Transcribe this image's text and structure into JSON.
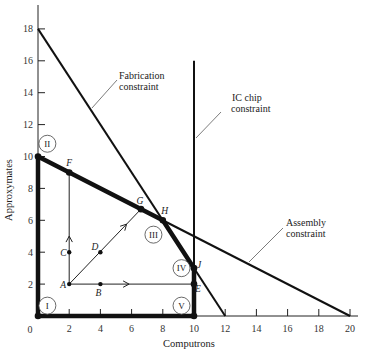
{
  "chart_data": {
    "type": "line",
    "title": "",
    "xlabel": "Computrons",
    "ylabel": "Approxymates",
    "xlim": [
      0,
      20
    ],
    "ylim": [
      0,
      18
    ],
    "grid": false,
    "x_ticks": [
      "0",
      "2",
      "4",
      "6",
      "8",
      "10",
      "12",
      "14",
      "16",
      "18",
      "20"
    ],
    "y_ticks": [
      "2",
      "4",
      "6",
      "8",
      "10",
      "12",
      "14",
      "16",
      "18"
    ],
    "origin_label": "0",
    "constraints": [
      {
        "name": "Fabrication constraint",
        "label_line1": "Fabrication",
        "label_line2": "constraint",
        "points": [
          [
            0,
            18
          ],
          [
            12,
            0
          ]
        ]
      },
      {
        "name": "Assembly constraint",
        "label_line1": "Assembly",
        "label_line2": "constraint",
        "points": [
          [
            0,
            10
          ],
          [
            20,
            0
          ]
        ]
      },
      {
        "name": "IC chip constraint",
        "label_line1": "IC chip",
        "label_line2": "constraint",
        "points": [
          [
            10,
            0
          ],
          [
            10,
            16
          ]
        ]
      }
    ],
    "feasible_region": [
      [
        0,
        0
      ],
      [
        0,
        10
      ],
      [
        8,
        6
      ],
      [
        10,
        3
      ],
      [
        10,
        0
      ]
    ],
    "points": [
      {
        "label": "A",
        "x": 2,
        "y": 2
      },
      {
        "label": "B",
        "x": 4,
        "y": 2
      },
      {
        "label": "C",
        "x": 2,
        "y": 4
      },
      {
        "label": "D",
        "x": 4,
        "y": 4
      },
      {
        "label": "E",
        "x": 10,
        "y": 2
      },
      {
        "label": "F",
        "x": 2,
        "y": 9
      },
      {
        "label": "G",
        "x": 6.6,
        "y": 6.7
      },
      {
        "label": "H",
        "x": 8,
        "y": 6
      },
      {
        "label": "J",
        "x": 10,
        "y": 3
      }
    ],
    "paths": [
      {
        "from": "A",
        "to": "F",
        "via": "C",
        "arrow": true
      },
      {
        "from": "A",
        "to": "G",
        "via": "D",
        "arrow": true
      },
      {
        "from": "A",
        "to": "E",
        "via": "B",
        "arrow": true
      }
    ],
    "regions": [
      {
        "label": "I",
        "x": 0.6,
        "y": 0.65
      },
      {
        "label": "II",
        "x": 0.6,
        "y": 10.8
      },
      {
        "label": "III",
        "x": 7.4,
        "y": 5.1
      },
      {
        "label": "IV",
        "x": 9.2,
        "y": 3.0
      },
      {
        "label": "V",
        "x": 9.2,
        "y": 0.65
      }
    ]
  }
}
